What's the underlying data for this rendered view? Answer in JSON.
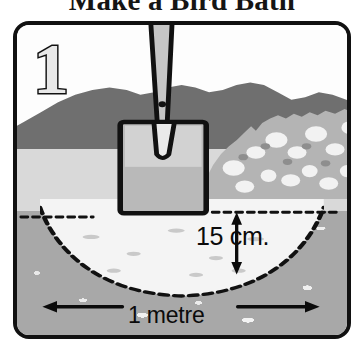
{
  "page": {
    "title": "Make a Bird Bath"
  },
  "panel": {
    "step_number": "1",
    "dimensions": {
      "depth_label": "15 cm.",
      "width_label": "1 metre"
    },
    "scene": {
      "sky_label": "sky",
      "hills_label": "distant hills",
      "midground_label": "middle ground",
      "foreground_label": "foreground soil",
      "spoil_label": "excavated soil heap",
      "hole_label": "dug hole",
      "ground_line_label": "ground level line",
      "spade_label": "spade"
    }
  },
  "colors": {
    "ink": "#111111",
    "sky": "#fdfdfd",
    "hills": "#6f6f6f",
    "midground": "#d9d9d9",
    "foreground": "#a8a8a8",
    "hole_fill": "#f4f4f4",
    "spade_blade_top": "#d2d2d2",
    "spade_blade_bottom": "#9a9a9a",
    "step_number_fill": "#e8e8e8"
  }
}
